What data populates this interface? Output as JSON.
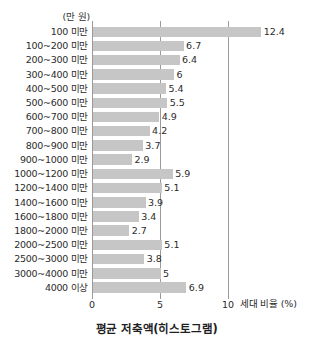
{
  "chart_data": {
    "type": "bar",
    "orientation": "horizontal",
    "title": "평균 저축액(히스토그램)",
    "unit_caption": "(만 원)",
    "xlabel": "세대 비율 (%)",
    "ylabel": "",
    "xlim": [
      0,
      10
    ],
    "xticks": [
      0,
      5,
      10
    ],
    "xtick_labels": [
      "0",
      "5",
      "10"
    ],
    "grid": true,
    "legend": "none",
    "bar_color": "#c6c6c6",
    "axis_color": "#9a9a9a",
    "text_color": "#2b2b2b",
    "categories": [
      "100 미만",
      "100~200 미만",
      "200~300 미만",
      "300~400 미만",
      "400~500 미만",
      "500~600 미만",
      "600~700 미만",
      "700~800 미만",
      "800~900 미만",
      "900~1000 미만",
      "1000~1200 미만",
      "1200~1400 미만",
      "1400~1600 미만",
      "1600~1800 미만",
      "1800~2000 미만",
      "2000~2500 미만",
      "2500~3000 미만",
      "3000~4000 미만",
      "4000 이상"
    ],
    "values": [
      12.4,
      6.7,
      6.4,
      6,
      5.4,
      5.5,
      4.9,
      4.2,
      3.7,
      2.9,
      5.9,
      5.1,
      3.9,
      3.4,
      2.7,
      5.1,
      3.8,
      5,
      6.9
    ],
    "value_labels": [
      "12.4",
      "6.7",
      "6.4",
      "6",
      "5.4",
      "5.5",
      "4.9",
      "4.2",
      "3.7",
      "2.9",
      "5.9",
      "5.1",
      "3.9",
      "3.4",
      "2.7",
      "5.1",
      "3.8",
      "5",
      "6.9"
    ]
  }
}
